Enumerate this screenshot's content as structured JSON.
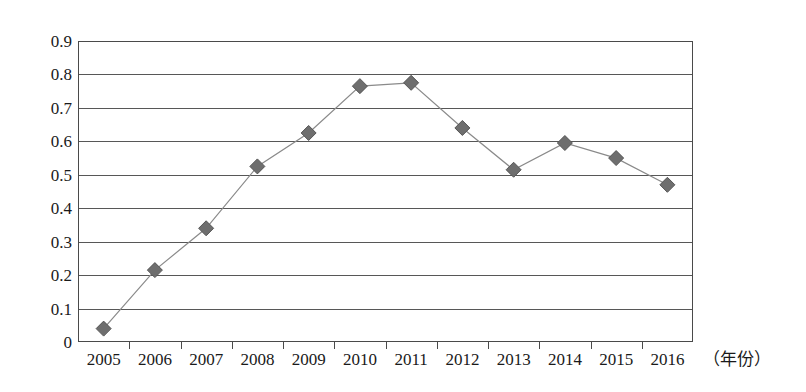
{
  "chart_data": {
    "type": "line",
    "title": "",
    "xlabel": "（年份）",
    "ylabel": "",
    "categories": [
      "2005",
      "2006",
      "2007",
      "2008",
      "2009",
      "2010",
      "2011",
      "2012",
      "2013",
      "2014",
      "2015",
      "2016"
    ],
    "x": [
      2005,
      2006,
      2007,
      2008,
      2009,
      2010,
      2011,
      2012,
      2013,
      2014,
      2015,
      2016
    ],
    "values": [
      0.04,
      0.215,
      0.34,
      0.525,
      0.625,
      0.765,
      0.775,
      0.64,
      0.515,
      0.595,
      0.55,
      0.47
    ],
    "series": [
      {
        "name": "",
        "values": [
          0.04,
          0.215,
          0.34,
          0.525,
          0.625,
          0.765,
          0.775,
          0.64,
          0.515,
          0.595,
          0.55,
          0.47
        ]
      }
    ],
    "ylim": [
      0,
      0.9
    ],
    "yticks": [
      0,
      0.1,
      0.2,
      0.3,
      0.4,
      0.5,
      0.6,
      0.7,
      0.8,
      0.9
    ],
    "ytick_labels": [
      "0",
      "0.1",
      "0.2",
      "0.3",
      "0.4",
      "0.5",
      "0.6",
      "0.7",
      "0.8",
      "0.9"
    ],
    "grid": "horizontal",
    "legend": "none",
    "marker": "diamond",
    "marker_color": "#6e6e6e",
    "line_color": "#8a8a8a",
    "gridline_color": "#575757",
    "frame_color": "#4a4a4a",
    "annotations": []
  }
}
